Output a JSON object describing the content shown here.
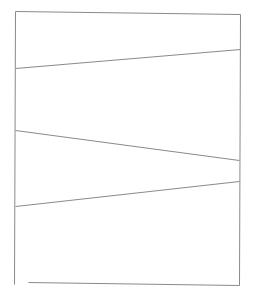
{
  "canvas": {
    "width": 253,
    "height": 297,
    "background": "#ffffff"
  },
  "stroke": {
    "color": "#8a8a8a",
    "width": 1
  },
  "lines": [
    {
      "name": "top-edge",
      "x1": 15,
      "y1": 11,
      "x2": 240,
      "y2": 14
    },
    {
      "name": "left-edge",
      "x1": 15,
      "y1": 11,
      "x2": 14,
      "y2": 284
    },
    {
      "name": "right-edge",
      "x1": 240,
      "y1": 14,
      "x2": 239,
      "y2": 285
    },
    {
      "name": "bottom-edge",
      "x1": 28,
      "y1": 282,
      "x2": 239,
      "y2": 285
    },
    {
      "name": "diagonal-1",
      "x1": 15,
      "y1": 68,
      "x2": 240,
      "y2": 49
    },
    {
      "name": "diagonal-2",
      "x1": 15,
      "y1": 130,
      "x2": 239,
      "y2": 160
    },
    {
      "name": "diagonal-3",
      "x1": 15,
      "y1": 206,
      "x2": 239,
      "y2": 181
    }
  ]
}
